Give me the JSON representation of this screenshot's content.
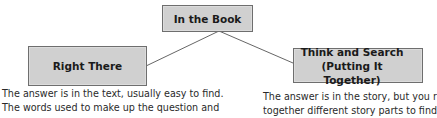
{
  "diagram": {
    "root": {
      "label": "In the Book"
    },
    "children": [
      {
        "title_line1": "Right There",
        "description_lines": [
          "The answer is in the text, usually easy to find.",
          "The words used to make up the question and"
        ]
      },
      {
        "title_line1": "Think and Search",
        "title_line2": "(Putting It Together)",
        "description_lines": [
          "The answer is in the story, but you r",
          "together different story parts to find"
        ]
      }
    ],
    "colors": {
      "box_fill": "#d0d0d0",
      "box_border": "#6e6e6e",
      "connector": "#555555",
      "text": "#1a1a1a"
    }
  }
}
